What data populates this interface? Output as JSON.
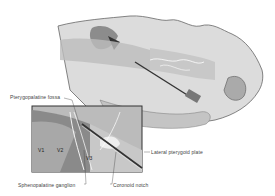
{
  "figure": {
    "labels": {
      "pterygopalatine_fossa": "Pterygopalatine fossa",
      "sphenopalatine_ganglion": "Sphenopalatine ganglion",
      "coronoid_notch": "Coronoid notch",
      "lateral_pterygoid_plate": "Lateral pterygoid plate",
      "v1": "V1",
      "v2": "V2",
      "v3": "V3"
    },
    "colors": {
      "skin": "#d9d9d9",
      "shadow": "#9a9a9a",
      "outline": "#555555",
      "inset_border": "#333333"
    }
  }
}
